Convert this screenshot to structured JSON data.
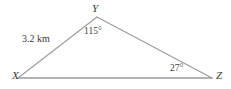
{
  "figure": {
    "type": "triangle-diagram",
    "shape_name": "XYZ",
    "background_color": "#ffffff",
    "line_color": "#9a9a9a",
    "text_color": "#3a3a3a",
    "vertices": [
      {
        "id": "X",
        "label": "X",
        "x": 18,
        "y": 78
      },
      {
        "id": "Y",
        "label": "Y",
        "x": 97,
        "y": 17
      },
      {
        "id": "Z",
        "label": "Z",
        "x": 212,
        "y": 78
      }
    ],
    "sides": [
      {
        "id": "XY",
        "from": "X",
        "to": "Y",
        "measure_label": "3.2 km"
      },
      {
        "id": "YZ",
        "from": "Y",
        "to": "Z",
        "measure_label": ""
      },
      {
        "id": "XZ",
        "from": "X",
        "to": "Z",
        "measure_label": ""
      }
    ],
    "angles": [
      {
        "at": "Y",
        "label": "115°",
        "value": 115,
        "unit": "degrees"
      },
      {
        "at": "Z",
        "label": "27°",
        "value": 27,
        "unit": "degrees"
      }
    ],
    "labels": {
      "vertex_x": "X",
      "vertex_y": "Y",
      "vertex_z": "Z",
      "angle_at_y": "115°",
      "angle_at_z": "27°",
      "side_xy_length": "3.2 km"
    }
  }
}
